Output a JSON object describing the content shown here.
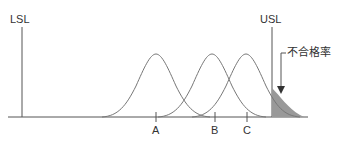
{
  "diagram": {
    "lsl_label": "LSL",
    "usl_label": "USL",
    "defect_rate_label": "不合格率",
    "distributions": [
      {
        "name": "A",
        "mean_x": 156
      },
      {
        "name": "B",
        "mean_x": 212
      },
      {
        "name": "C",
        "mean_x": 246
      }
    ],
    "colors": {
      "line": "#555555",
      "fill": "#999999"
    }
  }
}
